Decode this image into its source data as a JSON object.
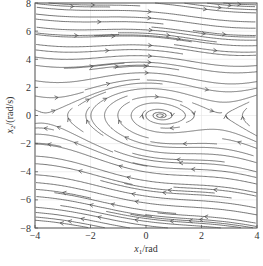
{
  "chart_data": {
    "type": "streamplot",
    "title": "",
    "xlabel": "x1/rad",
    "xlabel_main": "x",
    "xlabel_sub": "1",
    "xlabel_unit": "/rad",
    "ylabel": "x2/(rad/s)",
    "ylabel_main": "x",
    "ylabel_sub": "2",
    "ylabel_unit": "/(rad/s)",
    "xlim": [
      -4,
      4
    ],
    "ylim": [
      -8,
      8
    ],
    "xticks": [
      -4,
      -2,
      0,
      2,
      4
    ],
    "xtick_labels": [
      "−4",
      "−2",
      "0",
      "2",
      "4"
    ],
    "yticks": [
      -8,
      -6,
      -4,
      -2,
      0,
      2,
      4,
      6,
      8
    ],
    "ytick_labels": [
      "−8",
      "−6",
      "−4",
      "−2",
      "0",
      "2",
      "4",
      "6",
      "8"
    ],
    "grid": true,
    "legend": null,
    "system": {
      "description": "phase portrait of damped pendulum with constant torque",
      "dx1": "x2",
      "dx2": "torque - sin(x1) - damping*x2",
      "torque": 0.5,
      "damping": 0.2
    },
    "equilibria": [
      {
        "type": "stable focus",
        "x1": 0.52,
        "x2": 0
      },
      {
        "type": "saddle",
        "x1": 2.62,
        "x2": 0
      },
      {
        "type": "saddle",
        "x1": -3.67,
        "x2": 0
      }
    ]
  },
  "colors": {
    "stream": "#4a4a4a",
    "axis": "#555555",
    "grid": "#e4e4e4",
    "text": "#333333"
  },
  "caption": {
    "visible": true,
    "text_legible": false
  }
}
